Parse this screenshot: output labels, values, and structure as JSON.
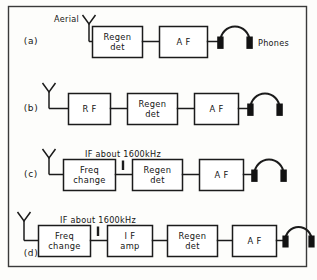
{
  "figure": {
    "border_color": "#3a3a3a",
    "line_color": "#1b1b1b",
    "background": "#fdfdfb",
    "rows": [
      {
        "id": "row-a",
        "label": "(a)",
        "aerial_label": "Aerial",
        "phones_label": "Phones",
        "if_note": "",
        "blocks": [
          {
            "name": "regen-det",
            "line1": "Regen",
            "line2": "det"
          },
          {
            "name": "af",
            "line1": "A F",
            "line2": ""
          }
        ]
      },
      {
        "id": "row-b",
        "label": "(b)",
        "aerial_label": "",
        "phones_label": "",
        "if_note": "",
        "blocks": [
          {
            "name": "rf",
            "line1": "R F",
            "line2": ""
          },
          {
            "name": "regen-det",
            "line1": "Regen",
            "line2": "det"
          },
          {
            "name": "af",
            "line1": "A F",
            "line2": ""
          }
        ]
      },
      {
        "id": "row-c",
        "label": "(c)",
        "aerial_label": "",
        "phones_label": "",
        "if_note": "IF about 1600kHz",
        "blocks": [
          {
            "name": "freq-change",
            "line1": "Freq",
            "line2": "change"
          },
          {
            "name": "regen-det",
            "line1": "Regen",
            "line2": "det"
          },
          {
            "name": "af",
            "line1": "A F",
            "line2": ""
          }
        ]
      },
      {
        "id": "row-d",
        "label": "(d)",
        "aerial_label": "",
        "phones_label": "",
        "if_note": "IF about 1600kHz",
        "blocks": [
          {
            "name": "freq-change",
            "line1": "Freq",
            "line2": "change"
          },
          {
            "name": "if-amp",
            "line1": "I F",
            "line2": "amp"
          },
          {
            "name": "regen-det",
            "line1": "Regen",
            "line2": "det"
          },
          {
            "name": "af",
            "line1": "A F",
            "line2": ""
          }
        ]
      }
    ]
  }
}
